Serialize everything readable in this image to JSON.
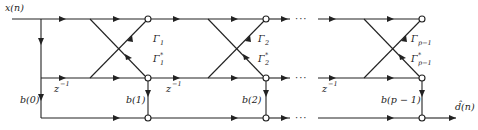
{
  "diagram": {
    "type": "lattice-ladder filter signal flow graph",
    "input_label": "x(n)",
    "output_label": "d̂(n)",
    "delay_label": "z",
    "delay_exp": "−1",
    "continuation": "···",
    "stages": [
      {
        "gamma": "Γ",
        "gamma_sub": "1",
        "gamma_conj_sub": "1",
        "tap": "b(1)"
      },
      {
        "gamma": "Γ",
        "gamma_sub": "2",
        "gamma_conj_sub": "2",
        "tap": "b(2)"
      },
      {
        "gamma": "Γ",
        "gamma_sub": "p−1",
        "gamma_conj_sub": "p−1",
        "tap": "b(p − 1)"
      }
    ],
    "initial_tap": "b(0)",
    "conj_mark": "*"
  }
}
